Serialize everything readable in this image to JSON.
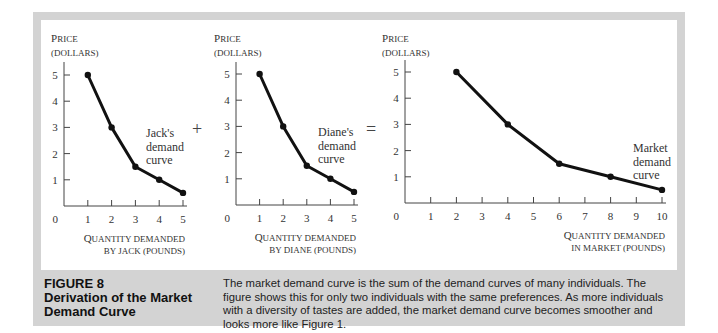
{
  "figure": {
    "number_label": "FIGURE 8",
    "title_line1": "Derivation of the Market",
    "title_line2": "Demand Curve",
    "caption": "The market demand curve is the sum of the demand curves of many individuals. The figure shows this for only two individuals with the same preferences. As more individuals with a diversity of tastes are added, the market demand curve becomes smoother and looks more like Figure 1.",
    "operators": {
      "plus": "+",
      "equals": "="
    }
  },
  "chart_data": [
    {
      "type": "line",
      "title": "Jack's demand curve",
      "ylabel_line1": "Price",
      "ylabel_line2": "(DOLLARS)",
      "xlabel_line1": "Quantity Demanded",
      "xlabel_line2": "BY JACK (POUNDS)",
      "annotation": [
        "Jack's",
        "demand",
        "curve"
      ],
      "x": [
        1,
        2,
        3,
        4,
        5
      ],
      "y": [
        5,
        3,
        1.5,
        1,
        0.5
      ],
      "xticks": [
        1,
        2,
        3,
        4,
        5
      ],
      "yticks": [
        1,
        2,
        3,
        4,
        5
      ],
      "origin_label": "0",
      "xlim": [
        0,
        5
      ],
      "ylim": [
        0,
        5.5
      ],
      "grid": false
    },
    {
      "type": "line",
      "title": "Diane's demand curve",
      "ylabel_line1": "Price",
      "ylabel_line2": "(DOLLARS)",
      "xlabel_line1": "Quantity Demanded",
      "xlabel_line2": "BY DIANE (POUNDS)",
      "annotation": [
        "Diane's",
        "demand",
        "curve"
      ],
      "x": [
        1,
        2,
        3,
        4,
        5
      ],
      "y": [
        5,
        3,
        1.5,
        1,
        0.5
      ],
      "xticks": [
        1,
        2,
        3,
        4,
        5
      ],
      "yticks": [
        1,
        2,
        3,
        4,
        5
      ],
      "origin_label": "0",
      "xlim": [
        0,
        5
      ],
      "ylim": [
        0,
        5.5
      ],
      "grid": false
    },
    {
      "type": "line",
      "title": "Market demand curve",
      "ylabel_line1": "Price",
      "ylabel_line2": "(DOLLARS)",
      "xlabel_line1": "Quantity Demanded",
      "xlabel_line2": "IN MARKET (POUNDS)",
      "annotation": [
        "Market",
        "demand",
        "curve"
      ],
      "x": [
        2,
        4,
        6,
        8,
        10
      ],
      "y": [
        5,
        3,
        1.5,
        1,
        0.5
      ],
      "xticks": [
        1,
        2,
        3,
        4,
        5,
        6,
        7,
        8,
        9,
        10
      ],
      "yticks": [
        1,
        2,
        3,
        4,
        5
      ],
      "origin_label": "0",
      "xlim": [
        0,
        10
      ],
      "ylim": [
        0,
        5.5
      ],
      "grid": false
    }
  ]
}
